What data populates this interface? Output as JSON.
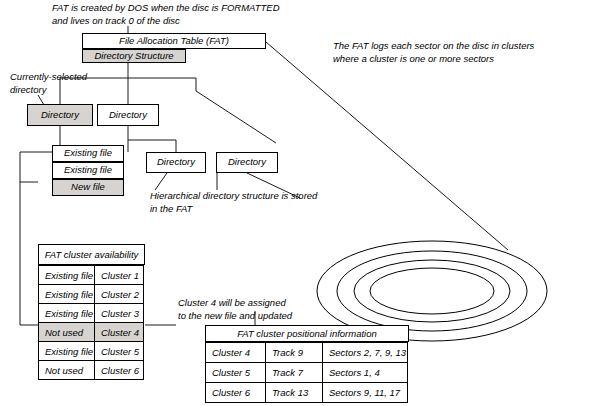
{
  "notes": {
    "fat_created": "FAT is created by DOS when the disc is FORMATTED\nand lives on track 0 of the disc",
    "fat_logs": "The FAT logs each sector on the disc in clusters\nwhere a cluster is one or more sectors",
    "currently_selected": "Currently-selected\ndirectory",
    "hierarchical": "Hierarchical directory structure is stored\nin the FAT",
    "cluster4_note": "Cluster 4 will be assigned\nto the new file and updated"
  },
  "tree": {
    "fat_box": "File Allocation Table (FAT)",
    "directory_structure": "Directory Structure",
    "dir_left": "Directory",
    "dir_right": "Directory",
    "file1": "Existing file",
    "file2": "Existing file",
    "file3": "New file",
    "sub_dir_left": "Directory",
    "sub_dir_right": "Directory"
  },
  "availability_table": {
    "title": "FAT cluster availability",
    "rows": [
      {
        "status": "Existing file",
        "cluster": "Cluster 1",
        "shaded": false
      },
      {
        "status": "Existing file",
        "cluster": "Cluster 2",
        "shaded": false
      },
      {
        "status": "Existing file",
        "cluster": "Cluster 3",
        "shaded": false
      },
      {
        "status": "Not used",
        "cluster": "Cluster 4",
        "shaded": true
      },
      {
        "status": "Existing file",
        "cluster": "Cluster 5",
        "shaded": false
      },
      {
        "status": "Not used",
        "cluster": "Cluster 6",
        "shaded": false
      }
    ]
  },
  "positional_table": {
    "title": "FAT cluster positional information",
    "rows": [
      {
        "cluster": "Cluster 4",
        "track": "Track 9",
        "sectors": "Sectors 2, 7, 9, 13"
      },
      {
        "cluster": "Cluster 5",
        "track": "Track 7",
        "sectors": "Sectors 1, 4"
      },
      {
        "cluster": "Cluster 6",
        "track": "Track 13",
        "sectors": "Sectors 9, 11, 17"
      }
    ]
  },
  "disc": {
    "label": "disc-platter-illustration"
  }
}
